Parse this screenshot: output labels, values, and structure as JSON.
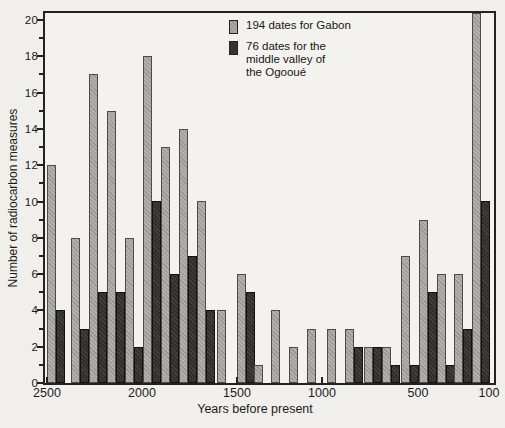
{
  "figure": {
    "background_color": "#f1efec",
    "frame_color": "#23221f"
  },
  "legend": {
    "gabon_label": "194 dates for Gabon",
    "ogooue_label_lines": [
      "76 dates for the",
      "middle valley of",
      "the Ogooué"
    ]
  },
  "chart_data": {
    "type": "bar",
    "title": "",
    "xlabel": "Years before present",
    "ylabel": "Number of radiocarbon measures",
    "ylim": [
      0,
      20
    ],
    "grid": false,
    "legend_position": "top-right-inside",
    "y_tick_labels": [
      "0",
      "2",
      "4",
      "6",
      "8",
      "10",
      "12",
      "14",
      "16",
      "18",
      "20"
    ],
    "y_minor_ticks_every": 1,
    "x_ticks": [
      {
        "label": "2500",
        "px": 2
      },
      {
        "label": "2000",
        "px": 97
      },
      {
        "label": "1500",
        "px": 192
      },
      {
        "label": "1000",
        "px": 277
      },
      {
        "label": "500",
        "px": 373
      },
      {
        "label": "100",
        "px": 444
      }
    ],
    "group_x_px": [
      2,
      26,
      44,
      62,
      80,
      98,
      116,
      134,
      152,
      172,
      192,
      209,
      226,
      244,
      262,
      282,
      300,
      319,
      337,
      356,
      374,
      392,
      409,
      427
    ],
    "series": [
      {
        "name": "194 dates for Gabon",
        "key": "gabon",
        "stated_total": 194,
        "color": "#abaaa6",
        "values": [
          12,
          8,
          17,
          15,
          8,
          18,
          13,
          14,
          10,
          4,
          6,
          1,
          4,
          2,
          3,
          3,
          3,
          2,
          2,
          7,
          9,
          6,
          6,
          20
        ]
      },
      {
        "name": "76 dates for the middle valley of the Ogooué",
        "key": "ogooue",
        "stated_total": 76,
        "color": "#363531",
        "values": [
          4,
          3,
          5,
          5,
          2,
          10,
          6,
          7,
          4,
          null,
          5,
          null,
          null,
          null,
          null,
          null,
          2,
          2,
          1,
          1,
          5,
          1,
          3,
          10
        ]
      }
    ],
    "clipped_top_series0_index": 23
  }
}
